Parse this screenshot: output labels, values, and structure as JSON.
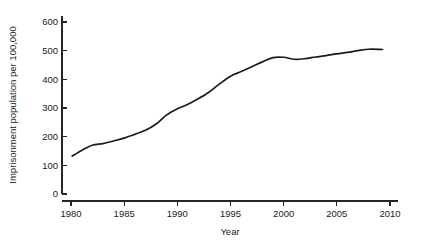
{
  "chart_data": {
    "type": "line",
    "title": "",
    "xlabel": "Year",
    "ylabel": "Imprisonment population per 100,000",
    "xlim": [
      1979,
      2010.5
    ],
    "ylim": [
      0,
      620
    ],
    "grid": false,
    "legend": null,
    "x_ticks": [
      1980,
      1985,
      1990,
      1995,
      2000,
      2005,
      2010
    ],
    "x_tick_labels": [
      "1980",
      "1985",
      "1990",
      "1995",
      "2000",
      "2005",
      "2010"
    ],
    "y_ticks": [
      0,
      100,
      200,
      300,
      400,
      500,
      600
    ],
    "y_tick_labels": [
      "0",
      "100",
      "200",
      "300",
      "400",
      "500",
      "600"
    ],
    "series": [
      {
        "name": "Imprisonment rate",
        "color": "#1c1c1c",
        "x": [
          1980.1,
          1981,
          1982,
          1983,
          1984,
          1985,
          1986,
          1987,
          1988,
          1989,
          1990,
          1991,
          1992,
          1993,
          1994,
          1995,
          1996,
          1997,
          1998,
          1999,
          2000,
          2001,
          2002,
          2003,
          2004,
          2005,
          2006,
          2007,
          2008,
          2009.3
        ],
        "values": [
          132,
          152,
          170,
          176,
          185,
          195,
          208,
          222,
          244,
          276,
          297,
          313,
          333,
          356,
          385,
          411,
          427,
          444,
          461,
          476,
          477,
          470,
          472,
          478,
          483,
          489,
          494,
          500,
          505,
          504
        ]
      }
    ]
  },
  "axis": {
    "x_title": "Year",
    "y_title": "Imprisonment population per 100,000"
  }
}
